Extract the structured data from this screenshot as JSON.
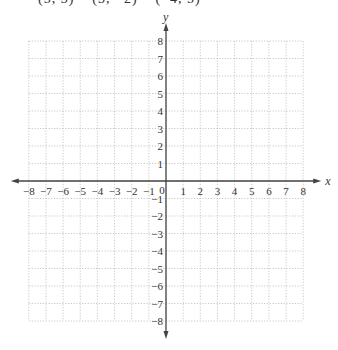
{
  "header_clipped_text": "(5, 3)    (3, −2)    (−4, 5)",
  "chart_data": {
    "type": "scatter",
    "title": "",
    "xlabel": "x",
    "ylabel": "y",
    "xlim": [
      -8,
      8
    ],
    "ylim": [
      -8,
      8
    ],
    "grid": true,
    "x_ticks": [
      -8,
      -7,
      -6,
      -5,
      -4,
      -3,
      -2,
      -1,
      0,
      1,
      2,
      3,
      4,
      5,
      6,
      7,
      8
    ],
    "y_ticks": [
      -8,
      -7,
      -6,
      -5,
      -4,
      -3,
      -2,
      -1,
      1,
      2,
      3,
      4,
      5,
      6,
      7,
      8
    ],
    "x_tick_labels": [
      "−8",
      "−7",
      "−6",
      "−5",
      "−4",
      "−3",
      "−2",
      "−1",
      "0",
      "1",
      "2",
      "3",
      "4",
      "5",
      "6",
      "7",
      "8"
    ],
    "y_tick_labels": [
      "−8",
      "−7",
      "−6",
      "−5",
      "−4",
      "−3",
      "−2",
      "−1",
      "1",
      "2",
      "3",
      "4",
      "5",
      "6",
      "7",
      "8"
    ],
    "points": [],
    "origin_label": "0"
  }
}
